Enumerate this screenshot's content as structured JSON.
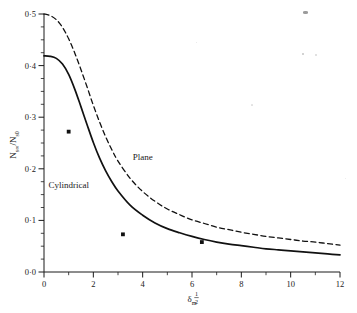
{
  "chart_data": {
    "type": "line",
    "title": "",
    "xlabel": "δm^1/2",
    "ylabel": "Ns∞/Ns0",
    "xlim": [
      0,
      12
    ],
    "ylim": [
      0,
      0.5
    ],
    "grid": false,
    "legend_position": "inline-labels",
    "xticks": [
      0,
      2,
      4,
      6,
      8,
      10,
      12
    ],
    "xtick_labels": [
      "0",
      "2",
      "4",
      "6",
      "8",
      "10",
      "12"
    ],
    "yticks": [
      0.0,
      0.1,
      0.2,
      0.3,
      0.4,
      0.5
    ],
    "ytick_labels": [
      "0·0",
      "0·1",
      "0·2",
      "0·3",
      "0·4",
      "0·5"
    ],
    "minor_xtick_step": 1,
    "minor_ytick_step": 0.025,
    "series": [
      {
        "name": "Plane",
        "style": "dashed",
        "color": "#111111",
        "label_x": 4.0,
        "label_y": 0.218,
        "x": [
          0,
          0.25,
          0.5,
          0.75,
          1.0,
          1.25,
          1.5,
          1.75,
          2.0,
          2.25,
          2.5,
          2.75,
          3.0,
          3.5,
          4.0,
          4.5,
          5.0,
          5.5,
          6.0,
          6.5,
          7.0,
          7.5,
          8.0,
          8.5,
          9.0,
          9.5,
          10.0,
          10.5,
          11.0,
          11.5,
          12.0
        ],
        "y": [
          0.5,
          0.497,
          0.489,
          0.474,
          0.452,
          0.424,
          0.392,
          0.358,
          0.323,
          0.291,
          0.262,
          0.237,
          0.215,
          0.181,
          0.156,
          0.137,
          0.122,
          0.111,
          0.101,
          0.094,
          0.087,
          0.082,
          0.077,
          0.073,
          0.069,
          0.066,
          0.063,
          0.06,
          0.058,
          0.055,
          0.052
        ]
      },
      {
        "name": "Cylindrical",
        "style": "solid",
        "color": "#111111",
        "label_x": 1.0,
        "label_y": 0.163,
        "x": [
          0,
          0.25,
          0.5,
          0.75,
          1.0,
          1.25,
          1.5,
          1.75,
          2.0,
          2.25,
          2.5,
          2.75,
          3.0,
          3.5,
          4.0,
          4.5,
          5.0,
          5.5,
          6.0,
          6.5,
          7.0,
          7.5,
          8.0,
          8.5,
          9.0,
          9.5,
          10.0,
          10.5,
          11.0,
          11.5,
          12.0
        ],
        "y": [
          0.419,
          0.418,
          0.414,
          0.403,
          0.383,
          0.354,
          0.32,
          0.285,
          0.251,
          0.221,
          0.196,
          0.175,
          0.157,
          0.129,
          0.11,
          0.095,
          0.084,
          0.076,
          0.069,
          0.063,
          0.058,
          0.054,
          0.051,
          0.048,
          0.045,
          0.043,
          0.041,
          0.039,
          0.037,
          0.035,
          0.033
        ]
      }
    ],
    "data_points": {
      "name": "experimental points",
      "marker": "square",
      "color": "#111111",
      "points": [
        {
          "x": 1.0,
          "y": 0.272
        },
        {
          "x": 3.2,
          "y": 0.073
        },
        {
          "x": 6.4,
          "y": 0.058
        }
      ]
    }
  },
  "axes": {
    "y_label_parts": {
      "n1": "N",
      "sub1": "s∞",
      "slash": "/",
      "n2": "N",
      "sub2": "s0"
    },
    "x_label_parts": {
      "delta": "δ",
      "sub": "m",
      "sup_num": "1",
      "sup_den": "2"
    }
  },
  "annotations": [
    {
      "name": "plane-curve-label",
      "text": "Plane"
    },
    {
      "name": "cylindrical-curve-label",
      "text": "Cylindrical"
    }
  ],
  "scan_artifacts": [
    {
      "x": 303,
      "y": 11,
      "w": 5,
      "h": 2.5,
      "opacity": 0.85
    },
    {
      "x": 302,
      "y": 53,
      "w": 2,
      "h": 2,
      "opacity": 0.45
    },
    {
      "x": 315,
      "y": 54,
      "w": 1.6,
      "h": 1.6,
      "opacity": 0.3
    },
    {
      "x": 196,
      "y": 42,
      "w": 1.4,
      "h": 1.4,
      "opacity": 0.22
    },
    {
      "x": 251,
      "y": 104,
      "w": 1.5,
      "h": 1.5,
      "opacity": 0.25
    },
    {
      "x": 345,
      "y": 178,
      "w": 1.4,
      "h": 1.4,
      "opacity": 0.2
    }
  ]
}
